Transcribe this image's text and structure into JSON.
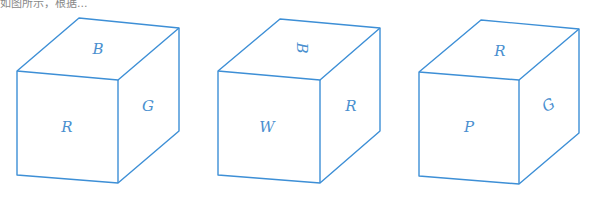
{
  "caption": "如图所示，根据...",
  "color": {
    "line": "#3d8fd6",
    "label": "#4a8fcf"
  },
  "cubes": [
    {
      "id": "cube-1",
      "top": "B",
      "front": "R",
      "side": "G",
      "top_rotation": 0,
      "side_rotation": 0
    },
    {
      "id": "cube-2",
      "top": "B",
      "front": "W",
      "side": "R",
      "top_rotation": 90,
      "side_rotation": 0
    },
    {
      "id": "cube-3",
      "top": "R",
      "front": "P",
      "side": "G",
      "top_rotation": 0,
      "side_rotation": -30
    }
  ]
}
